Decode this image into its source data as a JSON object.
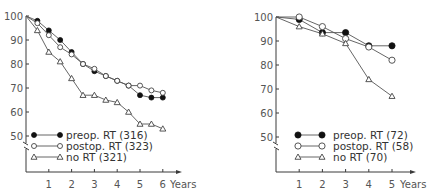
{
  "chart_data": [
    {
      "type": "line",
      "title": "",
      "xlabel": "Years",
      "ylabel": "",
      "x": [
        0,
        0.5,
        1,
        1.5,
        2,
        2.5,
        3,
        3.5,
        4,
        4.5,
        5,
        5.5,
        6
      ],
      "x_ticks": [
        "1",
        "2",
        "3",
        "4",
        "5",
        "6"
      ],
      "y_ticks": [
        "50",
        "60",
        "70",
        "80",
        "90",
        "100"
      ],
      "ylim": [
        45,
        100
      ],
      "xlim": [
        0,
        6.5
      ],
      "axis_break": true,
      "grid": false,
      "legend_position": "lower-left inside",
      "series": [
        {
          "name": "preop. RT (316)",
          "marker": "filled-circle",
          "values": [
            100,
            98,
            94,
            90,
            85,
            80,
            77,
            75,
            73,
            71,
            67,
            66,
            66
          ]
        },
        {
          "name": "postop. RT (323)",
          "marker": "open-circle",
          "values": [
            100,
            97,
            92,
            87,
            84,
            80,
            78,
            75,
            73,
            71,
            71,
            69,
            68
          ]
        },
        {
          "name": "no RT (321)",
          "marker": "open-triangle",
          "values": [
            100,
            94,
            85,
            81,
            74,
            67,
            67,
            65,
            64,
            60,
            55,
            55,
            53
          ]
        }
      ]
    },
    {
      "type": "line",
      "title": "",
      "xlabel": "Years",
      "ylabel": "",
      "x": [
        0,
        1,
        2,
        3,
        4,
        5
      ],
      "x_ticks": [
        "1",
        "2",
        "3",
        "4",
        "5"
      ],
      "y_ticks": [
        "50",
        "60",
        "70",
        "80",
        "90",
        "100"
      ],
      "ylim": [
        45,
        100
      ],
      "xlim": [
        0,
        5.5
      ],
      "axis_break": true,
      "grid": false,
      "legend_position": "lower-left inside",
      "series": [
        {
          "name": "preop. RT (72)",
          "marker": "filled-circle",
          "values": [
            100,
            99,
            93.5,
            93.5,
            88,
            88
          ]
        },
        {
          "name": "postop. RT (58)",
          "marker": "open-circle",
          "values": [
            100,
            100,
            96,
            91,
            87.5,
            82
          ]
        },
        {
          "name": "no RT (70)",
          "marker": "open-triangle",
          "values": [
            100,
            96,
            93,
            89,
            74,
            67
          ]
        }
      ]
    }
  ],
  "layout": {
    "panels": [
      {
        "origin_x": 26,
        "y100": 16,
        "px_per_10": 24,
        "x_axis_y": 172,
        "px_per_year": 22.8,
        "x_axis_end": 178,
        "years_label_x": 170,
        "legend_x": 34,
        "legend_y": 135,
        "legend_line_len": 26,
        "legend_text_x": 66,
        "marker_r": 2.2,
        "tri": 3
      },
      {
        "origin_x": 276,
        "y100": 17,
        "px_per_10": 24,
        "x_axis_y": 172,
        "px_per_year": 23.2,
        "x_axis_end": 412,
        "years_label_x": 400,
        "legend_x": 298,
        "legend_y": 135,
        "legend_line_len": 24,
        "legend_text_x": 333,
        "marker_r": 2.8,
        "tri": 3
      }
    ]
  }
}
